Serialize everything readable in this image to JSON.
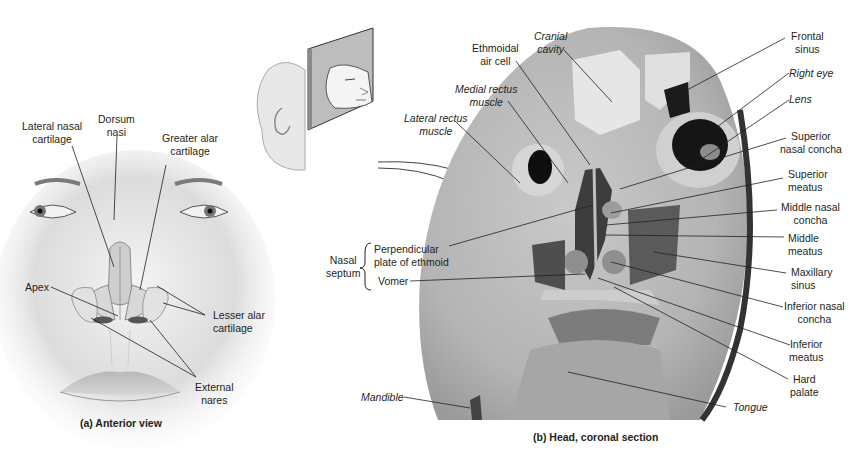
{
  "figure": {
    "panel_a": {
      "caption": "(a) Anterior view",
      "labels": {
        "lateral_nasal_cartilage": "Lateral nasal\ncartilage",
        "dorsum_nasi": "Dorsum\nnasi",
        "greater_alar_cartilage": "Greater alar\ncartilage",
        "apex": "Apex",
        "lesser_alar_cartilage": "Lesser alar\ncartilage",
        "external_nares": "External\nnares"
      }
    },
    "panel_b": {
      "caption": "(b) Head, coronal section",
      "labels": {
        "ethmoidal_air_cell": "Ethmoidal\nair cell",
        "cranial_cavity": "Cranial\ncavity",
        "medial_rectus_muscle": "Medial rectus\nmuscle",
        "lateral_rectus_muscle": "Lateral rectus\nmuscle",
        "frontal_sinus": "Frontal\nsinus",
        "right_eye": "Right eye",
        "lens": "Lens",
        "superior_nasal_concha": "Superior\nnasal concha",
        "superior_meatus": "Superior\nmeatus",
        "middle_nasal_concha": "Middle nasal\nconcha",
        "middle_meatus": "Middle\nmeatus",
        "maxillary_sinus": "Maxillary\nsinus",
        "inferior_nasal_concha": "Inferior nasal\nconcha",
        "inferior_meatus": "Inferior\nmeatus",
        "hard_palate": "Hard\npalate",
        "tongue": "Tongue",
        "mandible": "Mandible",
        "nasal_septum": "Nasal\nseptum",
        "perpendicular_plate": "Perpendicular\nplate of ethmoid",
        "vomer": "Vomer"
      }
    }
  }
}
